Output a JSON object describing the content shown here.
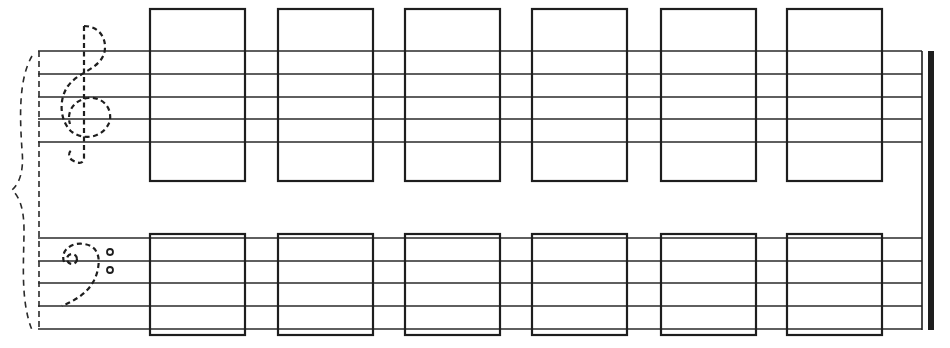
{
  "worksheet": {
    "title": "Grand staff note-writing worksheet",
    "ink_color": "#1e1e1e",
    "line_color": "#2a2a2a",
    "background": "#ffffff",
    "treble_staff": {
      "clef": "treble-clef-dashed",
      "lines_y": [
        51,
        74,
        97,
        119,
        142
      ],
      "x_start": 38,
      "x_end": 922
    },
    "bass_staff": {
      "clef": "bass-clef-dashed",
      "lines_y": [
        238,
        261,
        283,
        306,
        329
      ],
      "x_start": 38,
      "x_end": 922
    },
    "answer_boxes": {
      "count_per_staff": 6,
      "x": [
        150,
        278,
        405,
        532,
        661,
        787
      ],
      "width": 95,
      "treble_top": 9,
      "treble_bottom": 181,
      "bass_top": 234,
      "bass_bottom": 335
    },
    "final_barline": {
      "thin_x": 922,
      "thick_x": 931,
      "top": 51,
      "bottom": 330
    },
    "brace": "grand-staff-brace-dashed"
  }
}
